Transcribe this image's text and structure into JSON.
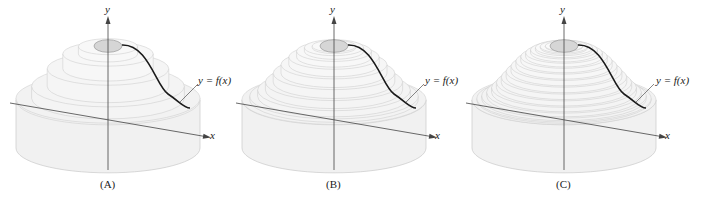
{
  "figure": {
    "panels": [
      {
        "id": "A",
        "caption": "(A)",
        "shells": 5,
        "offset_x": 0
      },
      {
        "id": "B",
        "caption": "(B)",
        "shells": 10,
        "offset_x": 235
      },
      {
        "id": "C",
        "caption": "(C)",
        "shells": 16,
        "offset_x": 466
      }
    ],
    "labels": {
      "y_axis": "y",
      "x_axis": "x",
      "curve": "y = f(x)"
    },
    "colors": {
      "solid_fill": "#f1f1f1",
      "solid_edge": "#c9c9c9",
      "hole_fill": "#d6d6d6",
      "curve": "#1a1a1a",
      "axis": "#444444"
    }
  }
}
